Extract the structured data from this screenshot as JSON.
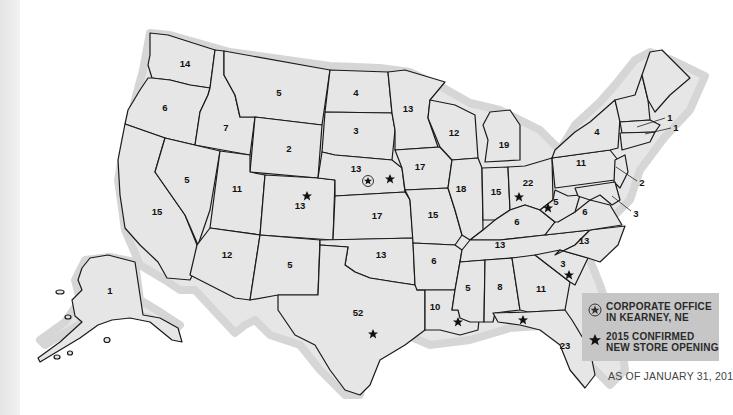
{
  "map": {
    "title": "Store locations by state",
    "states": [
      {
        "abbr": "WA",
        "count": "14"
      },
      {
        "abbr": "OR",
        "count": "6"
      },
      {
        "abbr": "CA",
        "count": "15"
      },
      {
        "abbr": "ID",
        "count": "7"
      },
      {
        "abbr": "NV",
        "count": "5"
      },
      {
        "abbr": "MT",
        "count": "5"
      },
      {
        "abbr": "WY",
        "count": "2"
      },
      {
        "abbr": "UT",
        "count": "11"
      },
      {
        "abbr": "AZ",
        "count": "12"
      },
      {
        "abbr": "CO",
        "count": "13"
      },
      {
        "abbr": "NM",
        "count": "5"
      },
      {
        "abbr": "ND",
        "count": "4"
      },
      {
        "abbr": "SD",
        "count": "3"
      },
      {
        "abbr": "NE",
        "count": "13"
      },
      {
        "abbr": "KS",
        "count": "17"
      },
      {
        "abbr": "OK",
        "count": "13"
      },
      {
        "abbr": "TX",
        "count": "52"
      },
      {
        "abbr": "MN",
        "count": "13"
      },
      {
        "abbr": "IA",
        "count": "17"
      },
      {
        "abbr": "MO",
        "count": "15"
      },
      {
        "abbr": "AR",
        "count": "6"
      },
      {
        "abbr": "LA",
        "count": "10"
      },
      {
        "abbr": "WI",
        "count": "12"
      },
      {
        "abbr": "IL",
        "count": "18"
      },
      {
        "abbr": "MI",
        "count": "19"
      },
      {
        "abbr": "IN",
        "count": "15"
      },
      {
        "abbr": "OH",
        "count": "22"
      },
      {
        "abbr": "KY",
        "count": "6"
      },
      {
        "abbr": "TN",
        "count": "13"
      },
      {
        "abbr": "MS",
        "count": "5"
      },
      {
        "abbr": "AL",
        "count": "8"
      },
      {
        "abbr": "GA",
        "count": "11"
      },
      {
        "abbr": "FL",
        "count": "23"
      },
      {
        "abbr": "SC",
        "count": "3"
      },
      {
        "abbr": "NC",
        "count": "13"
      },
      {
        "abbr": "VA",
        "count": "6"
      },
      {
        "abbr": "WV",
        "count": "5"
      },
      {
        "abbr": "PA",
        "count": "11"
      },
      {
        "abbr": "NY",
        "count": "4"
      },
      {
        "abbr": "MA",
        "count": "1"
      },
      {
        "abbr": "RI",
        "count": "1"
      },
      {
        "abbr": "NJ",
        "count": "2"
      },
      {
        "abbr": "MD",
        "count": "3"
      },
      {
        "abbr": "AK",
        "count": "1"
      }
    ]
  },
  "legend": {
    "corporate_office": "CORPORATE OFFICE\nIN KEARNEY, NE",
    "new_store": "2015 CONFIRMED\nNEW STORE OPENING",
    "as_of": "AS OF JANUARY 31, 201"
  },
  "colors": {
    "land": "#e6e6e6",
    "border": "#1a1a1a",
    "legend_bg": "#c6c6c6"
  },
  "icons": {
    "corporate": "circled-star-icon",
    "new_store": "star-icon"
  }
}
